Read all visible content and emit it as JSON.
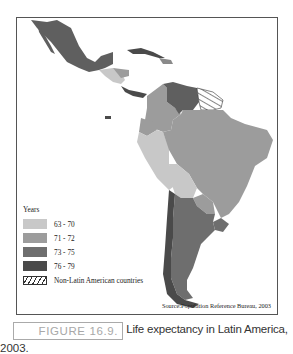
{
  "figure": {
    "label": "FIGURE 16.9.",
    "caption": "Life expectancy in Latin America,",
    "caption_year": "2003."
  },
  "map": {
    "title": "Life expectancy in Latin America, 2003",
    "source": "Source:Population Reference Bureau, 2003",
    "legend": {
      "title": "Years",
      "items": [
        {
          "label": "63 - 70",
          "color": "#c8c8c8"
        },
        {
          "label": "71 - 72",
          "color": "#9c9c9c"
        },
        {
          "label": "73 - 75",
          "color": "#6e6e6e"
        },
        {
          "label": "76 - 79",
          "color": "#4a4a4a"
        },
        {
          "label": "Non-Latin American countries",
          "color": "hatch"
        }
      ]
    },
    "regions": [
      {
        "name": "Mexico",
        "class": "73 - 75"
      },
      {
        "name": "Cuba",
        "class": "76 - 79"
      },
      {
        "name": "Central America (Guatemala/Honduras/Nicaragua)",
        "class": "63 - 70"
      },
      {
        "name": "Costa Rica / Panama",
        "class": "76 - 79"
      },
      {
        "name": "Venezuela",
        "class": "73 - 75"
      },
      {
        "name": "Guianas",
        "class": "Non-Latin American countries"
      },
      {
        "name": "Colombia",
        "class": "71 - 72"
      },
      {
        "name": "Ecuador",
        "class": "71 - 72"
      },
      {
        "name": "Peru",
        "class": "63 - 70"
      },
      {
        "name": "Bolivia",
        "class": "63 - 70"
      },
      {
        "name": "Brazil",
        "class": "71 - 72"
      },
      {
        "name": "Paraguay",
        "class": "71 - 72"
      },
      {
        "name": "Chile",
        "class": "76 - 79"
      },
      {
        "name": "Argentina",
        "class": "73 - 75"
      },
      {
        "name": "Uruguay",
        "class": "73 - 75"
      }
    ]
  }
}
